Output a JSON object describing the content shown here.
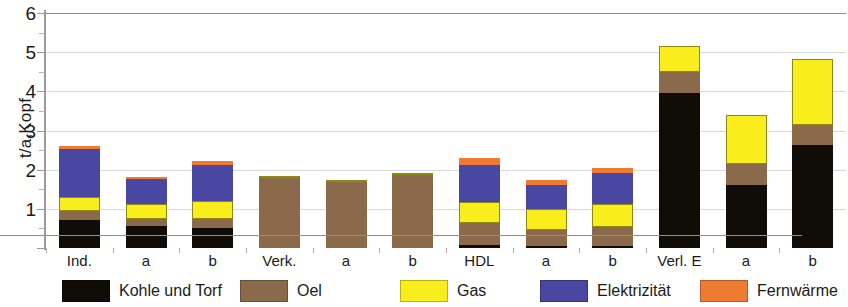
{
  "chart_data": {
    "type": "bar",
    "stacked": true,
    "title": "",
    "xlabel": "",
    "ylabel": "t/a,Kopf",
    "ylim": [
      0,
      6
    ],
    "yticks": [
      0,
      1,
      2,
      3,
      4,
      5,
      6
    ],
    "ytick_labels": [
      "",
      "1",
      "2",
      "3",
      "4",
      "5",
      "6"
    ],
    "minor_ticks": true,
    "grid": true,
    "legend_position": "bottom",
    "categories": [
      "Ind.",
      "a",
      "b",
      "Verk.",
      "a",
      "b",
      "HDL",
      "a",
      "b",
      "Verl. E",
      "a",
      "b"
    ],
    "series": [
      {
        "name": "Kohle und Torf",
        "color": "#100c08",
        "values": [
          0.72,
          0.55,
          0.5,
          0.0,
          0.0,
          0.0,
          0.08,
          0.05,
          0.06,
          3.95,
          1.62,
          2.62
        ]
      },
      {
        "name": "Oel",
        "color": "#8a6a4b",
        "values": [
          0.22,
          0.2,
          0.25,
          1.78,
          1.68,
          1.86,
          0.55,
          0.42,
          0.48,
          0.55,
          0.52,
          0.52
        ]
      },
      {
        "name": "Gas",
        "color": "#f9ee1b",
        "values": [
          0.36,
          0.38,
          0.45,
          0.06,
          0.05,
          0.06,
          0.55,
          0.52,
          0.58,
          0.65,
          1.25,
          1.68
        ]
      },
      {
        "name": "Elektrizität",
        "color": "#4a47a3",
        "values": [
          1.22,
          0.62,
          0.93,
          0.0,
          0.0,
          0.0,
          0.95,
          0.62,
          0.8,
          0.0,
          0.0,
          0.0
        ]
      },
      {
        "name": "Fernwärme",
        "color": "#ef7a33",
        "values": [
          0.09,
          0.07,
          0.08,
          0.0,
          0.0,
          0.0,
          0.17,
          0.13,
          0.13,
          0.0,
          0.0,
          0.0
        ]
      }
    ],
    "totals": [
      2.61,
      1.82,
      2.21,
      1.84,
      1.73,
      1.92,
      2.3,
      1.74,
      2.05,
      5.15,
      3.39,
      4.82
    ]
  },
  "legend": {
    "items": [
      {
        "label": "Kohle und Torf",
        "key": "coal"
      },
      {
        "label": "Oel",
        "key": "oil"
      },
      {
        "label": "Gas",
        "key": "gas"
      },
      {
        "label": "Elektrizität",
        "key": "elec"
      },
      {
        "label": "Fernwärme",
        "key": "heat"
      }
    ]
  }
}
